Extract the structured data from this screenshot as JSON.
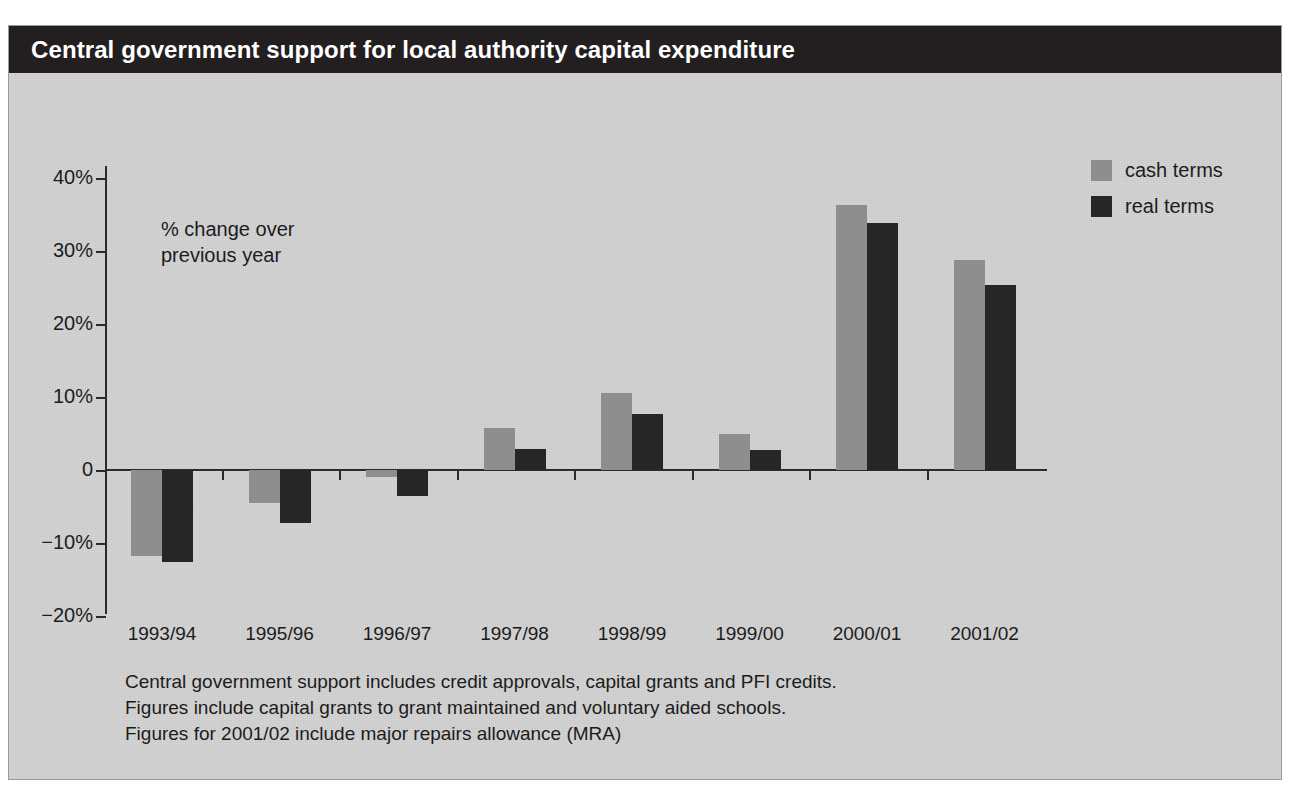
{
  "header": {
    "title": "Central government support for local authority capital expenditure"
  },
  "annotation": "% change over\nprevious year",
  "legend": {
    "items": [
      {
        "label": "cash terms",
        "color": "#8e8e8e"
      },
      {
        "label": "real terms",
        "color": "#262626"
      }
    ]
  },
  "footnotes": [
    "Central government support includes credit approvals, capital grants and PFI credits.",
    "Figures include capital grants to grant maintained and voluntary aided schools.",
    "Figures for 2001/02 include major repairs allowance (MRA)"
  ],
  "chart_data": {
    "type": "bar",
    "title": "Central government support for local authority capital expenditure",
    "subtitle": "% change over previous year",
    "xlabel": "",
    "ylabel": "% change over previous year",
    "ylim": [
      -20,
      40
    ],
    "yticks": [
      40,
      30,
      20,
      10,
      0,
      -10,
      -20
    ],
    "ytick_labels": [
      "40%",
      "30%",
      "20%",
      "10%",
      "0",
      "-10%",
      "-20%"
    ],
    "grid": false,
    "legend_position": "top-right",
    "categories": [
      "1993/94",
      "1995/96",
      "1996/97",
      "1997/98",
      "1998/99",
      "1999/00",
      "2000/01",
      "2001/02"
    ],
    "series": [
      {
        "name": "cash terms",
        "color": "#8e8e8e",
        "values": [
          -11.8,
          -4.5,
          -0.9,
          5.7,
          10.6,
          5.0,
          36.3,
          28.8
        ]
      },
      {
        "name": "real terms",
        "color": "#262626",
        "values": [
          -12.6,
          -7.3,
          -3.6,
          2.9,
          7.7,
          2.8,
          33.8,
          25.4
        ]
      }
    ]
  }
}
